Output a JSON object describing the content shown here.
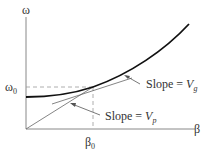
{
  "diagram": {
    "y_axis_label": "ω",
    "x_axis_label": "β",
    "omega0_label": {
      "base": "ω",
      "sub": "0"
    },
    "beta0_label": {
      "base": "β",
      "sub": "0"
    },
    "slope_g_label": {
      "text": "Slope = ",
      "var": "V",
      "sub": "g"
    },
    "slope_p_label": {
      "text": "Slope = ",
      "var": "V",
      "sub": "p"
    },
    "colors": {
      "axis": "#777777",
      "curve": "#111111",
      "dashed": "#888888",
      "lines": "#666666"
    }
  }
}
